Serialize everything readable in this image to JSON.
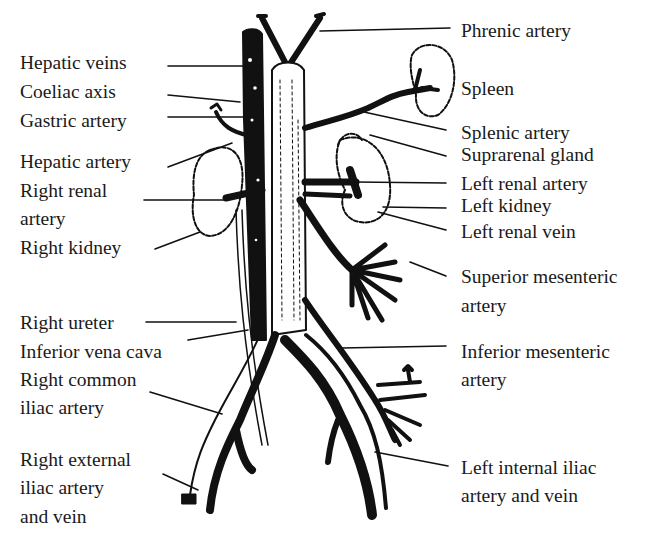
{
  "diagram": {
    "title": "",
    "labels_left": [
      {
        "id": "hepatic-veins",
        "text": "Hepatic veins",
        "x": 20,
        "y": 52
      },
      {
        "id": "coeliac-axis",
        "text": "Coeliac axis",
        "x": 20,
        "y": 81
      },
      {
        "id": "gastric-artery",
        "text": "Gastric artery",
        "x": 20,
        "y": 110
      },
      {
        "id": "hepatic-artery",
        "text": "Hepatic artery",
        "x": 20,
        "y": 151
      },
      {
        "id": "right-renal-artery-1",
        "text": "Right renal",
        "x": 20,
        "y": 180
      },
      {
        "id": "right-renal-artery-2",
        "text": "artery",
        "x": 20,
        "y": 208
      },
      {
        "id": "right-kidney",
        "text": "Right kidney",
        "x": 20,
        "y": 237
      },
      {
        "id": "right-ureter",
        "text": "Right ureter",
        "x": 20,
        "y": 312
      },
      {
        "id": "inferior-vena-cava",
        "text": "Inferior vena cava",
        "x": 20,
        "y": 341
      },
      {
        "id": "right-common-iliac-1",
        "text": "Right common",
        "x": 20,
        "y": 369
      },
      {
        "id": "right-common-iliac-2",
        "text": "iliac artery",
        "x": 20,
        "y": 397
      },
      {
        "id": "right-external-iliac-1",
        "text": "Right external",
        "x": 20,
        "y": 449
      },
      {
        "id": "right-external-iliac-2",
        "text": "iliac artery",
        "x": 20,
        "y": 477
      },
      {
        "id": "right-external-iliac-3",
        "text": "and vein",
        "x": 20,
        "y": 506
      }
    ],
    "labels_right": [
      {
        "id": "phrenic-artery",
        "text": "Phrenic artery",
        "x": 461,
        "y": 20
      },
      {
        "id": "spleen",
        "text": "Spleen",
        "x": 461,
        "y": 78
      },
      {
        "id": "splenic-artery",
        "text": "Splenic artery",
        "x": 461,
        "y": 122
      },
      {
        "id": "suprarenal-gland",
        "text": "Suprarenal gland",
        "x": 461,
        "y": 144
      },
      {
        "id": "left-renal-artery",
        "text": "Left renal artery",
        "x": 461,
        "y": 173
      },
      {
        "id": "left-kidney",
        "text": "Left kidney",
        "x": 461,
        "y": 195
      },
      {
        "id": "left-renal-vein",
        "text": "Left renal vein",
        "x": 461,
        "y": 221
      },
      {
        "id": "superior-mesenteric-1",
        "text": "Superior mesenteric",
        "x": 461,
        "y": 266
      },
      {
        "id": "superior-mesenteric-2",
        "text": "artery",
        "x": 461,
        "y": 295
      },
      {
        "id": "inferior-mesenteric-1",
        "text": "Inferior mesenteric",
        "x": 461,
        "y": 341
      },
      {
        "id": "inferior-mesenteric-2",
        "text": "artery",
        "x": 461,
        "y": 369
      },
      {
        "id": "left-internal-iliac-1",
        "text": "Left internal iliac",
        "x": 461,
        "y": 457
      },
      {
        "id": "left-internal-iliac-2",
        "text": "artery and vein",
        "x": 461,
        "y": 485
      }
    ],
    "colors": {
      "background": "#ffffff",
      "ink": "#111111",
      "text": "#1a1a1a"
    }
  }
}
